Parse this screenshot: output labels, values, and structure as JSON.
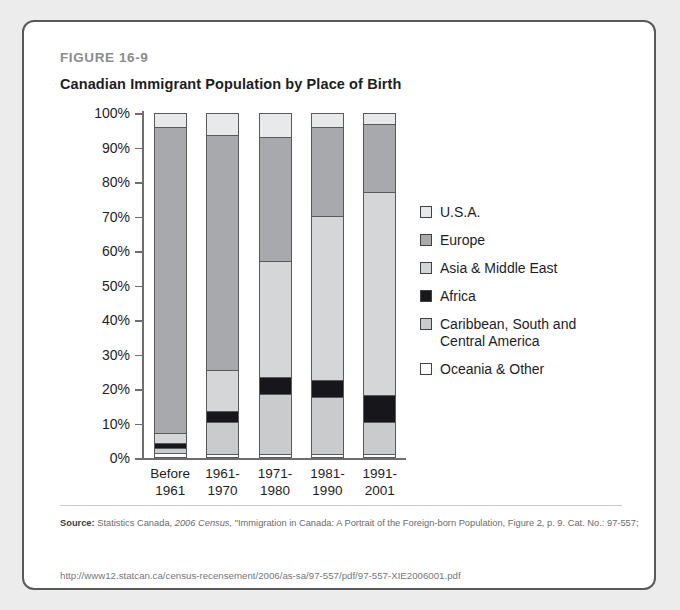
{
  "figure": {
    "label": "FIGURE 16-9",
    "title": "Canadian Immigrant Population by Place of Birth"
  },
  "source": {
    "prefix": "Source:",
    "text_a": " Statistics Canada, ",
    "italic": "2006 Census,",
    "text_b": " \"Immigration in Canada: A Portrait of the Foreign-born Population, Figure 2, p. 9. Cat. No.: 97-557;",
    "url": "http://www12.statcan.ca/census-recensement/2006/as-sa/97-557/pdf/97-557-XIE2006001.pdf"
  },
  "legend": {
    "items": [
      {
        "label": "U.S.A.",
        "color": "#e8e9ea"
      },
      {
        "label": "Europe",
        "color": "#a7a9ac"
      },
      {
        "label": "Asia & Middle East",
        "color": "#d5d6d8"
      },
      {
        "label": "Africa",
        "color": "#17161a"
      },
      {
        "label": "Caribbean, South and\nCentral America",
        "color": "#c9cbcd"
      },
      {
        "label": "Oceania & Other",
        "color": "#ffffff"
      }
    ]
  },
  "chart_data": {
    "type": "bar",
    "stacked": true,
    "title": "Canadian Immigrant Population by Place of Birth",
    "xlabel": "",
    "ylabel": "",
    "ylim": [
      0,
      100
    ],
    "yticks": [
      "0%",
      "10%",
      "20%",
      "30%",
      "40%",
      "50%",
      "60%",
      "70%",
      "80%",
      "90%",
      "100%"
    ],
    "grid": false,
    "legend_position": "right",
    "categories": [
      "Before\n1961",
      "1961-\n1970",
      "1971-\n1980",
      "1981-\n1990",
      "1991-\n2001"
    ],
    "series": [
      {
        "name": "Oceania & Other",
        "color": "#ffffff",
        "values": [
          0.8,
          0.5,
          0.6,
          0.5,
          0.5
        ]
      },
      {
        "name": "Caribbean, South and Central America",
        "color": "#c9cbcd",
        "values": [
          1.4,
          9.3,
          17.4,
          16.6,
          9.4
        ]
      },
      {
        "name": "Africa",
        "color": "#17161a",
        "values": [
          1.6,
          3.2,
          5.0,
          5.0,
          7.9
        ]
      },
      {
        "name": "Asia & Middle East",
        "color": "#d5d6d8",
        "values": [
          3.0,
          12.0,
          34.0,
          47.9,
          59.2
        ]
      },
      {
        "name": "Europe",
        "color": "#a7a9ac",
        "values": [
          89.2,
          68.7,
          36.0,
          25.9,
          19.9
        ]
      },
      {
        "name": "U.S.A.",
        "color": "#e8e9ea",
        "values": [
          4.0,
          6.3,
          7.0,
          4.1,
          3.1
        ]
      }
    ]
  }
}
